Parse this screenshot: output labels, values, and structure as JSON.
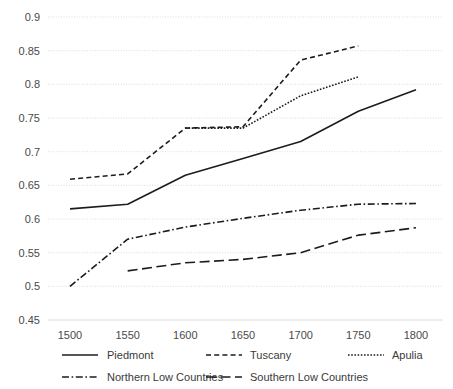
{
  "chart_data": {
    "type": "line",
    "title": "",
    "subtitle": "",
    "xlabel": "",
    "ylabel": "",
    "x": [
      1500,
      1550,
      1600,
      1650,
      1700,
      1750,
      1800
    ],
    "xtick_labels": [
      "1500",
      "1550",
      "1600",
      "1650",
      "1700",
      "1750",
      "1800"
    ],
    "ytick_labels": [
      "0.9",
      "0.85",
      "0.8",
      "0.75",
      "0.7",
      "0.65",
      "0.6",
      "0.55",
      "0.5",
      "0.45"
    ],
    "ytick_values": [
      0.9,
      0.85,
      0.8,
      0.75,
      0.7,
      0.65,
      0.6,
      0.55,
      0.5,
      0.45
    ],
    "xlim": [
      1490,
      1810
    ],
    "ylim": [
      0.45,
      0.9
    ],
    "grid": "horizontal-dotted",
    "legend_position": "bottom",
    "series": [
      {
        "name": "Piedmont",
        "style": "solid",
        "color": "#1c1c1c",
        "x": [
          1500,
          1550,
          1600,
          1650,
          1700,
          1750,
          1800
        ],
        "values": [
          0.615,
          0.622,
          0.665,
          0.69,
          0.715,
          0.76,
          0.792
        ]
      },
      {
        "name": "Tuscany",
        "style": "dashed",
        "color": "#1c1c1c",
        "x": [
          1500,
          1550,
          1600,
          1650,
          1700,
          1750
        ],
        "values": [
          0.659,
          0.667,
          0.735,
          0.737,
          0.836,
          0.857
        ]
      },
      {
        "name": "Apulia",
        "style": "dotted",
        "color": "#1c1c1c",
        "x": [
          1600,
          1650,
          1700,
          1750
        ],
        "values": [
          0.735,
          0.735,
          0.783,
          0.811
        ]
      },
      {
        "name": "Northern Low Countries",
        "style": "dashdot",
        "color": "#1c1c1c",
        "x": [
          1500,
          1550,
          1600,
          1650,
          1700,
          1750,
          1800
        ],
        "values": [
          0.5,
          0.57,
          0.588,
          0.601,
          0.613,
          0.622,
          0.623
        ]
      },
      {
        "name": "Southern Low Countries",
        "style": "longdash",
        "color": "#1c1c1c",
        "x": [
          1550,
          1600,
          1650,
          1700,
          1750,
          1800
        ],
        "values": [
          0.523,
          0.535,
          0.54,
          0.55,
          0.576,
          0.587
        ]
      }
    ],
    "legend": [
      {
        "label": "Piedmont",
        "style": "solid"
      },
      {
        "label": "Tuscany",
        "style": "dashed"
      },
      {
        "label": "Apulia",
        "style": "dotted"
      },
      {
        "label": "Northern Low Countries",
        "style": "dashdot"
      },
      {
        "label": "Southern Low Countries",
        "style": "longdash"
      }
    ]
  }
}
